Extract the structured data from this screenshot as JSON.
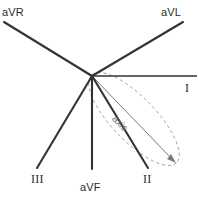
{
  "figure": {
    "width": 199,
    "height": 203,
    "background_color": "#ffffff",
    "origin": {
      "x": 92,
      "y": 76
    }
  },
  "colors": {
    "lead_line": "#333333",
    "axis_arrow": "#7a7a7a",
    "loop_dashed": "#9a9a9a",
    "label_text": "#2b2b2b",
    "axis_text": "#6e6e6e"
  },
  "leads": [
    {
      "id": "aVR",
      "label": "aVR",
      "label_x": 2,
      "label_y": 6,
      "x1": 92,
      "y1": 76,
      "x2": 4,
      "y2": 22,
      "label_style": "sans"
    },
    {
      "id": "aVL",
      "label": "aVL",
      "label_x": 161,
      "label_y": 6,
      "x1": 92,
      "y1": 76,
      "x2": 183,
      "y2": 22,
      "label_style": "sans"
    },
    {
      "id": "I",
      "label": "I",
      "label_x": 185,
      "label_y": 81,
      "x1": 92,
      "y1": 76,
      "x2": 197,
      "y2": 76,
      "label_style": "roman"
    },
    {
      "id": "II",
      "label": "II",
      "label_x": 143,
      "label_y": 172,
      "x1": 92,
      "y1": 76,
      "x2": 148,
      "y2": 168,
      "label_style": "roman"
    },
    {
      "id": "aVF",
      "label": "aVF",
      "label_x": 80,
      "label_y": 181,
      "x1": 92,
      "y1": 76,
      "x2": 92,
      "y2": 169,
      "label_style": "sans"
    },
    {
      "id": "III",
      "label": "III",
      "label_x": 31,
      "label_y": 172,
      "x1": 92,
      "y1": 76,
      "x2": 37,
      "y2": 168,
      "label_style": "roman"
    }
  ],
  "axis_vector": {
    "label": "axis",
    "label_x": 118,
    "label_y": 113,
    "label_rotation_deg": 46,
    "x1": 92,
    "y1": 76,
    "x2": 176,
    "y2": 163,
    "arrowhead": true
  },
  "loop": {
    "description": "dashed QRS vector loop ellipse",
    "center_x": 134,
    "center_y": 119,
    "radius_major": 61,
    "radius_minor": 22,
    "rotation_deg": 46,
    "dash_pattern": "3 3"
  }
}
